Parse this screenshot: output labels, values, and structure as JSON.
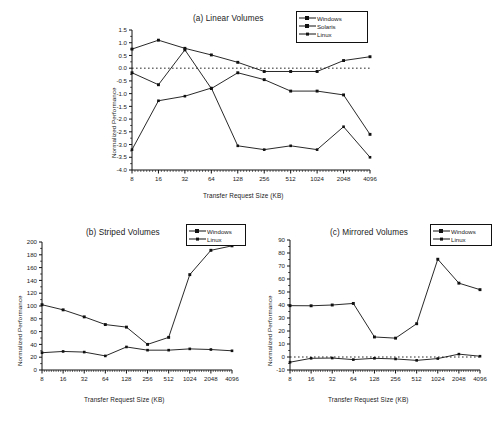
{
  "figure": {
    "axis_x_title": "Transfer Request Size (KB)",
    "axis_y_title": "Normalized Performance",
    "categories": [
      "8",
      "16",
      "32",
      "64",
      "128",
      "256",
      "512",
      "1024",
      "2048",
      "4096"
    ]
  },
  "panel_a": {
    "title": "(a) Linear Volumes",
    "legend": [
      "Windows",
      "Solaris",
      "Linux"
    ]
  },
  "panel_b": {
    "title": "(b) Striped Volumes",
    "legend": [
      "Windows",
      "Linux"
    ]
  },
  "panel_c": {
    "title": "(c) Mirrored Volumes",
    "legend": [
      "Windows",
      "Linux"
    ]
  },
  "chart_data": [
    {
      "id": "a",
      "type": "line",
      "title": "(a) Linear Volumes",
      "xlabel": "Transfer Request Size (KB)",
      "ylabel": "Normalized Performance",
      "categories": [
        "8",
        "16",
        "32",
        "64",
        "128",
        "256",
        "512",
        "1024",
        "2048",
        "4096"
      ],
      "ylim": [
        -4.0,
        1.5
      ],
      "yticks": [
        -4.0,
        -3.5,
        -3.0,
        -2.5,
        -2.0,
        -1.5,
        -1.0,
        -0.5,
        0.0,
        0.5,
        1.0,
        1.5
      ],
      "ytick_labels": [
        "-4.0",
        "-3.5",
        "-3.0",
        "-2.5",
        "-2.0",
        "-1.5",
        "-1.0",
        "-0.5",
        "0.0",
        "0.5",
        "1.0",
        "1.5"
      ],
      "zero_line": 0.0,
      "grid": false,
      "legend_position": "top-right",
      "series": [
        {
          "name": "Windows",
          "values": [
            0.75,
            1.1,
            0.78,
            0.52,
            0.23,
            -0.13,
            -0.13,
            -0.13,
            0.3,
            0.45
          ]
        },
        {
          "name": "Solaris",
          "values": [
            -0.18,
            -0.65,
            0.72,
            -0.8,
            -0.18,
            -0.45,
            -0.9,
            -0.9,
            -1.05,
            -2.6
          ]
        },
        {
          "name": "Linux",
          "values": [
            -3.2,
            -1.28,
            -1.1,
            -0.78,
            -3.05,
            -3.2,
            -3.05,
            -3.2,
            -2.3,
            -3.5
          ]
        }
      ]
    },
    {
      "id": "b",
      "type": "line",
      "title": "(b) Striped Volumes",
      "xlabel": "Transfer Request Size (KB)",
      "ylabel": "Normalized Performance",
      "categories": [
        "8",
        "16",
        "32",
        "64",
        "128",
        "256",
        "512",
        "1024",
        "2048",
        "4096"
      ],
      "ylim": [
        0,
        200
      ],
      "yticks": [
        0,
        20,
        40,
        60,
        80,
        100,
        120,
        140,
        160,
        180,
        200
      ],
      "ytick_labels": [
        "0",
        "20",
        "40",
        "60",
        "80",
        "100",
        "120",
        "140",
        "160",
        "180",
        "200"
      ],
      "grid": false,
      "legend_position": "top-right",
      "series": [
        {
          "name": "Windows",
          "values": [
            102,
            94,
            83,
            71,
            67,
            40,
            51,
            149,
            187,
            194
          ]
        },
        {
          "name": "Linux",
          "values": [
            27,
            29,
            28,
            22,
            36,
            31,
            31,
            33,
            32,
            30
          ]
        }
      ]
    },
    {
      "id": "c",
      "type": "line",
      "title": "(c) Mirrored Volumes",
      "xlabel": "Transfer Request Size (KB)",
      "ylabel": "Normalized Performance",
      "categories": [
        "8",
        "16",
        "32",
        "64",
        "128",
        "256",
        "512",
        "1024",
        "2048",
        "4096"
      ],
      "ylim": [
        -10,
        90
      ],
      "yticks": [
        -10,
        0,
        10,
        20,
        30,
        40,
        50,
        60,
        70,
        80,
        90
      ],
      "ytick_labels": [
        "-10",
        "0",
        "10",
        "20",
        "30",
        "40",
        "50",
        "60",
        "70",
        "80",
        "90"
      ],
      "zero_line": 0,
      "grid": false,
      "legend_position": "top-right",
      "series": [
        {
          "name": "Windows",
          "values": [
            39.5,
            39.4,
            40.0,
            41.2,
            15.4,
            14.5,
            25.6,
            75.2,
            56.8,
            51.8
          ]
        },
        {
          "name": "Linux",
          "values": [
            -4.0,
            -1.0,
            -0.8,
            -2.0,
            -1.0,
            -1.5,
            -2.6,
            -1.2,
            2.2,
            0.6
          ]
        }
      ]
    }
  ]
}
